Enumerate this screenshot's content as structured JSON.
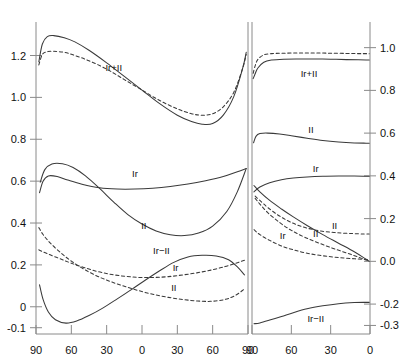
{
  "figure": {
    "title": "",
    "background": "#ffffff",
    "line_color": "#3a3a3a",
    "axis_color": "#8a8a8a",
    "text_color": "#111111"
  },
  "chart_data": {
    "type": "line",
    "title": "",
    "xlabel": "",
    "ylabel": "",
    "grid": false,
    "legend": "inline-curve-labels",
    "panels": [
      {
        "name": "left-panel",
        "xlabel": "",
        "ylabel": "",
        "x_axis_side": "bottom",
        "y_axis_side": "left",
        "xticks": [
          90,
          60,
          30,
          0,
          30,
          60,
          90
        ],
        "xtick_positions": [
          0,
          1,
          2,
          3,
          4,
          5,
          6
        ],
        "xlim": [
          0,
          6
        ],
        "yticks": [
          1.2,
          1.0,
          0.8,
          0.6,
          0.4,
          0.2,
          0,
          -0.1
        ],
        "ytick_labels": [
          "1.2",
          "1.0",
          "0.8",
          "0.6",
          "0.4",
          "0.2",
          "0",
          "-0.1"
        ],
        "ylim": [
          -0.13,
          1.36
        ],
        "series": [
          {
            "name": "Ir+II solid",
            "label": "Ir+II",
            "style": "solid",
            "label_x": 2.2,
            "label_y": 1.14,
            "x": [
              0.08,
              0.18,
              0.32,
              0.5,
              0.8,
              1.1,
              1.5,
              2.0,
              2.5,
              3.0,
              3.5,
              4.0,
              4.4,
              4.7,
              5.0,
              5.3,
              5.6,
              5.85,
              5.95
            ],
            "y": [
              1.17,
              1.255,
              1.29,
              1.295,
              1.285,
              1.265,
              1.225,
              1.165,
              1.1,
              1.035,
              0.97,
              0.915,
              0.885,
              0.872,
              0.875,
              0.915,
              1.005,
              1.14,
              1.215
            ]
          },
          {
            "name": "Ir+II dashed",
            "label": "Ir+II",
            "style": "dashed",
            "x": [
              0.08,
              0.18,
              0.32,
              0.5,
              0.8,
              1.1,
              1.5,
              2.0,
              2.5,
              3.0,
              3.5,
              4.0,
              4.4,
              4.7,
              5.0,
              5.3,
              5.6,
              5.85,
              5.95
            ],
            "y": [
              1.155,
              1.205,
              1.218,
              1.22,
              1.215,
              1.2,
              1.175,
              1.135,
              1.085,
              1.035,
              0.985,
              0.945,
              0.922,
              0.915,
              0.922,
              0.955,
              1.025,
              1.14,
              1.205
            ]
          },
          {
            "name": "Ir solid",
            "label": "Ir",
            "style": "solid",
            "label_x": 2.8,
            "label_y": 0.635,
            "x": [
              0.1,
              0.2,
              0.35,
              0.6,
              0.9,
              1.3,
              1.8,
              2.3,
              2.8,
              3.3,
              3.8,
              4.3,
              4.8,
              5.3,
              5.7,
              5.95
            ],
            "y": [
              0.545,
              0.6,
              0.625,
              0.622,
              0.605,
              0.585,
              0.568,
              0.562,
              0.562,
              0.566,
              0.574,
              0.586,
              0.602,
              0.622,
              0.645,
              0.66
            ]
          },
          {
            "name": "II solid",
            "label": "II",
            "style": "solid",
            "label_x": 3.05,
            "label_y": 0.385,
            "x": [
              0.12,
              0.25,
              0.45,
              0.75,
              1.05,
              1.4,
              1.8,
              2.2,
              2.6,
              3.0,
              3.4,
              3.8,
              4.2,
              4.6,
              5.0,
              5.4,
              5.7,
              5.95
            ],
            "y": [
              0.595,
              0.655,
              0.682,
              0.683,
              0.665,
              0.625,
              0.565,
              0.5,
              0.44,
              0.395,
              0.362,
              0.344,
              0.34,
              0.352,
              0.385,
              0.455,
              0.55,
              0.66
            ]
          },
          {
            "name": "Ir-II solid",
            "label": "Ir−II",
            "style": "solid",
            "label_x": 3.55,
            "label_y": 0.268,
            "x": [
              0.1,
              0.2,
              0.35,
              0.55,
              0.85,
              1.15,
              1.5,
              1.9,
              2.3,
              2.7,
              3.1,
              3.5,
              3.9,
              4.3,
              4.7,
              5.1,
              5.45,
              5.7,
              5.9
            ],
            "y": [
              0.105,
              0.035,
              -0.025,
              -0.062,
              -0.078,
              -0.068,
              -0.042,
              -0.005,
              0.038,
              0.082,
              0.128,
              0.172,
              0.212,
              0.238,
              0.246,
              0.243,
              0.225,
              0.19,
              0.152
            ]
          },
          {
            "name": "Ir dashed",
            "label": "Ir",
            "style": "dashed",
            "label_x": 3.95,
            "label_y": 0.185,
            "x": [
              0.08,
              0.2,
              0.4,
              0.7,
              1.0,
              1.35,
              1.75,
              2.15,
              2.55,
              2.95,
              3.35,
              3.75,
              4.15,
              4.55,
              4.95,
              5.35,
              5.65,
              5.9
            ],
            "y": [
              0.272,
              0.262,
              0.248,
              0.228,
              0.208,
              0.188,
              0.168,
              0.154,
              0.145,
              0.14,
              0.14,
              0.144,
              0.152,
              0.162,
              0.175,
              0.192,
              0.208,
              0.222
            ]
          },
          {
            "name": "II dashed",
            "label": "II",
            "style": "dashed",
            "label_x": 3.9,
            "label_y": 0.092,
            "x": [
              0.08,
              0.2,
              0.4,
              0.7,
              1.0,
              1.35,
              1.75,
              2.15,
              2.55,
              2.95,
              3.35,
              3.75,
              4.15,
              4.55,
              4.95,
              5.35,
              5.65,
              5.9
            ],
            "y": [
              0.378,
              0.345,
              0.305,
              0.258,
              0.218,
              0.18,
              0.145,
              0.118,
              0.095,
              0.075,
              0.058,
              0.045,
              0.035,
              0.028,
              0.026,
              0.035,
              0.055,
              0.085
            ]
          }
        ]
      },
      {
        "name": "right-panel",
        "xlabel": "",
        "ylabel": "",
        "x_axis_side": "bottom",
        "y_axis_side": "right",
        "xticks": [
          90,
          60,
          30,
          0
        ],
        "xtick_positions": [
          0,
          1,
          2,
          3
        ],
        "xlim": [
          0,
          3
        ],
        "yticks": [
          1.0,
          0.8,
          0.6,
          0.4,
          0.2,
          0.0,
          -0.2,
          -0.3
        ],
        "ytick_labels": [
          "1.0",
          "0.8",
          "0.6",
          "0.4",
          "0.2",
          "0.0",
          "-0.2",
          "-0.3"
        ],
        "ylim": [
          -0.34,
          1.12
        ],
        "series": [
          {
            "name": "Ir+II solid",
            "label": "Ir+II",
            "style": "solid",
            "label_x": 1.45,
            "label_y": 0.875,
            "x": [
              0.03,
              0.08,
              0.15,
              0.3,
              0.5,
              0.8,
              1.2,
              1.6,
              2.0,
              2.4,
              2.7,
              2.9,
              2.98
            ],
            "y": [
              0.855,
              0.878,
              0.905,
              0.932,
              0.942,
              0.946,
              0.947,
              0.947,
              0.946,
              0.944,
              0.943,
              0.942,
              0.942
            ]
          },
          {
            "name": "Ir+II dashed",
            "label": "Ir+II",
            "style": "dashed",
            "x": [
              0.03,
              0.08,
              0.15,
              0.3,
              0.5,
              0.8,
              1.2,
              1.6,
              2.0,
              2.4,
              2.7,
              2.9,
              2.98
            ],
            "y": [
              0.88,
              0.915,
              0.945,
              0.966,
              0.972,
              0.974,
              0.975,
              0.975,
              0.974,
              0.973,
              0.972,
              0.972,
              0.971
            ]
          },
          {
            "name": "II solid",
            "label": "II",
            "style": "solid",
            "label_x": 1.5,
            "label_y": 0.615,
            "x": [
              0.04,
              0.1,
              0.2,
              0.4,
              0.7,
              1.0,
              1.4,
              1.8,
              2.2,
              2.6,
              2.9,
              2.98
            ],
            "y": [
              0.555,
              0.585,
              0.598,
              0.6,
              0.596,
              0.588,
              0.576,
              0.565,
              0.558,
              0.554,
              0.553,
              0.553
            ]
          },
          {
            "name": "Ir solid",
            "label": "Ir",
            "style": "solid",
            "label_x": 1.62,
            "label_y": 0.43,
            "x": [
              0.05,
              0.2,
              0.45,
              0.75,
              1.05,
              1.4,
              1.8,
              2.2,
              2.6,
              2.9,
              2.98
            ],
            "y": [
              0.325,
              0.348,
              0.368,
              0.382,
              0.39,
              0.395,
              0.398,
              0.399,
              0.399,
              0.398,
              0.398
            ]
          },
          {
            "name": "Ir-II solid descending",
            "label": "",
            "style": "solid",
            "x": [
              0.05,
              0.2,
              0.45,
              0.75,
              1.05,
              1.4,
              1.8,
              2.2,
              2.6,
              2.88,
              2.98
            ],
            "y": [
              0.355,
              0.325,
              0.285,
              0.245,
              0.208,
              0.168,
              0.125,
              0.085,
              0.045,
              0.012,
              0.0
            ]
          },
          {
            "name": "II dashed",
            "label": "II",
            "style": "dashed",
            "label_x": 2.1,
            "label_y": 0.165,
            "x": [
              0.08,
              0.2,
              0.4,
              0.7,
              1.0,
              1.35,
              1.75,
              2.15,
              2.55,
              2.85,
              2.98
            ],
            "y": [
              0.305,
              0.285,
              0.252,
              0.212,
              0.182,
              0.158,
              0.142,
              0.134,
              0.13,
              0.128,
              0.128
            ]
          },
          {
            "name": "II dashed inner",
            "label": "II",
            "style": "dashed",
            "label_x": 1.62,
            "label_y": 0.128,
            "x": [
              0.08,
              0.2,
              0.4,
              0.7,
              1.0,
              1.35,
              1.75,
              2.15,
              2.55,
              2.85,
              2.98
            ],
            "y": [
              0.295,
              0.268,
              0.228,
              0.182,
              0.145,
              0.112,
              0.082,
              0.055,
              0.03,
              0.01,
              0.004
            ]
          },
          {
            "name": "Ir dashed",
            "label": "Ir",
            "style": "dashed",
            "label_x": 0.78,
            "label_y": 0.118,
            "x": [
              0.05,
              0.2,
              0.45,
              0.75,
              1.05,
              1.4,
              1.8,
              2.2,
              2.6,
              2.9,
              2.98
            ],
            "y": [
              0.148,
              0.125,
              0.098,
              0.072,
              0.054,
              0.038,
              0.026,
              0.018,
              0.012,
              0.008,
              0.007
            ]
          },
          {
            "name": "Ir-II solid bottom",
            "label": "Ir−II",
            "style": "solid",
            "label_x": 1.62,
            "label_y": -0.268,
            "x": [
              0.05,
              0.2,
              0.45,
              0.75,
              1.05,
              1.4,
              1.8,
              2.2,
              2.6,
              2.9,
              2.98
            ],
            "y": [
              -0.292,
              -0.288,
              -0.275,
              -0.258,
              -0.24,
              -0.222,
              -0.208,
              -0.198,
              -0.193,
              -0.192,
              -0.192
            ]
          }
        ]
      }
    ]
  }
}
